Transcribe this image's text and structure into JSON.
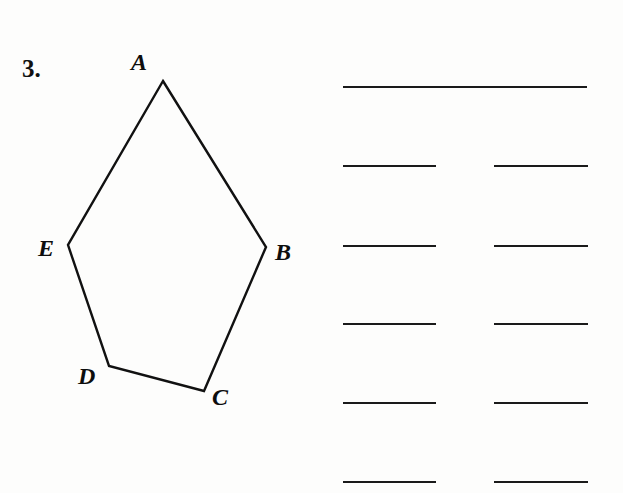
{
  "problem": {
    "number": "3."
  },
  "figure": {
    "type": "polygon",
    "name": "pentagon-ABCDE",
    "stroke_color": "#111111",
    "stroke_width": 2.4,
    "fill": "none",
    "vertices": [
      {
        "label": "A",
        "x": 163,
        "y": 81,
        "label_x": 131,
        "label_y": 50
      },
      {
        "label": "B",
        "x": 266,
        "y": 247,
        "label_x": 275,
        "label_y": 240
      },
      {
        "label": "C",
        "x": 204,
        "y": 391,
        "label_x": 212,
        "label_y": 385
      },
      {
        "label": "D",
        "x": 109,
        "y": 366,
        "label_x": 78,
        "label_y": 364
      },
      {
        "label": "E",
        "x": 68,
        "y": 245,
        "label_x": 38,
        "label_y": 236
      }
    ],
    "edges": [
      "A-B",
      "B-C",
      "C-D",
      "D-E",
      "E-A"
    ]
  },
  "answer_blanks": {
    "count": 11,
    "line_color": "#1a1a1a",
    "rows": [
      {
        "row": 1,
        "y": 86,
        "lines": [
          {
            "x": 343,
            "width": 244,
            "span": "full"
          }
        ]
      },
      {
        "row": 2,
        "y": 165,
        "lines": [
          {
            "x": 343,
            "width": 93,
            "span": "left"
          },
          {
            "x": 494,
            "width": 94,
            "span": "right"
          }
        ]
      },
      {
        "row": 3,
        "y": 245,
        "lines": [
          {
            "x": 343,
            "width": 93,
            "span": "left"
          },
          {
            "x": 494,
            "width": 94,
            "span": "right"
          }
        ]
      },
      {
        "row": 4,
        "y": 323,
        "lines": [
          {
            "x": 343,
            "width": 93,
            "span": "left"
          },
          {
            "x": 494,
            "width": 94,
            "span": "right"
          }
        ]
      },
      {
        "row": 5,
        "y": 402,
        "lines": [
          {
            "x": 343,
            "width": 93,
            "span": "left"
          },
          {
            "x": 494,
            "width": 94,
            "span": "right"
          }
        ]
      },
      {
        "row": 6,
        "y": 481,
        "lines": [
          {
            "x": 343,
            "width": 93,
            "span": "left"
          },
          {
            "x": 494,
            "width": 94,
            "span": "right"
          }
        ]
      }
    ]
  }
}
